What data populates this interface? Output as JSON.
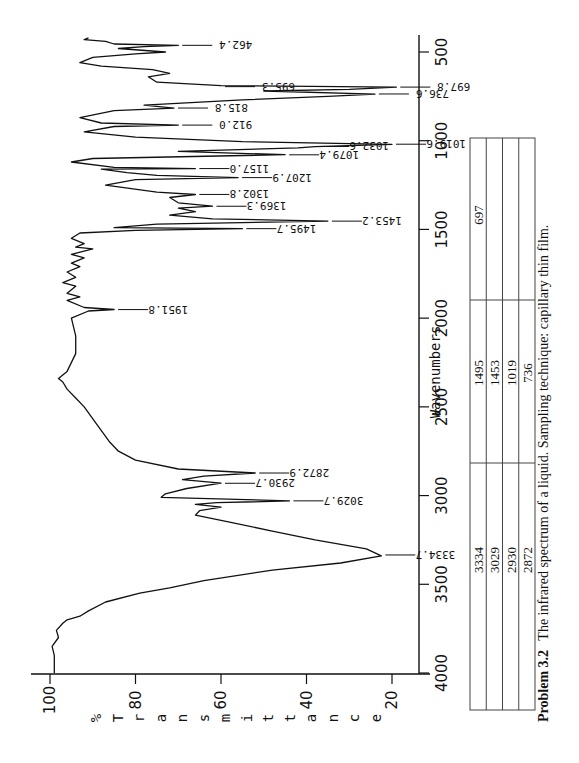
{
  "chart_data": {
    "type": "line",
    "title": "",
    "xlabel": "Wavenumbers",
    "ylabel": "% Transmittance",
    "x_reversed": true,
    "xlim": [
      4000,
      400
    ],
    "ylim": [
      15,
      102
    ],
    "orientation_note": "plot printed rotated 90 degrees clockwise on page",
    "x_ticks": [
      4000,
      3500,
      3000,
      2500,
      2000,
      1500,
      1000,
      500
    ],
    "y_ticks": [
      100,
      80,
      60,
      40,
      20
    ],
    "grid": false,
    "series": [
      {
        "name": "IR spectrum",
        "points": [
          [
            4000,
            99
          ],
          [
            3900,
            99
          ],
          [
            3850,
            99.5
          ],
          [
            3800,
            98
          ],
          [
            3760,
            98.5
          ],
          [
            3720,
            97
          ],
          [
            3700,
            96
          ],
          [
            3680,
            93
          ],
          [
            3650,
            91
          ],
          [
            3600,
            87
          ],
          [
            3550,
            79
          ],
          [
            3520,
            72
          ],
          [
            3480,
            64
          ],
          [
            3420,
            48
          ],
          [
            3380,
            32
          ],
          [
            3340,
            22.5
          ],
          [
            3300,
            26
          ],
          [
            3250,
            38
          ],
          [
            3200,
            48
          ],
          [
            3150,
            58
          ],
          [
            3110,
            66
          ],
          [
            3085,
            65
          ],
          [
            3065,
            60
          ],
          [
            3050,
            66
          ],
          [
            3040,
            61
          ],
          [
            3030,
            44
          ],
          [
            3010,
            74
          ],
          [
            2990,
            73
          ],
          [
            2960,
            68
          ],
          [
            2930,
            60
          ],
          [
            2910,
            69
          ],
          [
            2890,
            64
          ],
          [
            2873,
            52
          ],
          [
            2850,
            70
          ],
          [
            2800,
            80
          ],
          [
            2750,
            84
          ],
          [
            2700,
            86
          ],
          [
            2600,
            89
          ],
          [
            2500,
            92
          ],
          [
            2450,
            94
          ],
          [
            2400,
            96
          ],
          [
            2360,
            97
          ],
          [
            2340,
            98
          ],
          [
            2300,
            96
          ],
          [
            2200,
            94
          ],
          [
            2100,
            94
          ],
          [
            2000,
            95
          ],
          [
            1960,
            91
          ],
          [
            1951,
            85
          ],
          [
            1940,
            92
          ],
          [
            1900,
            96
          ],
          [
            1880,
            93
          ],
          [
            1860,
            96
          ],
          [
            1820,
            94
          ],
          [
            1800,
            97
          ],
          [
            1770,
            94
          ],
          [
            1740,
            96
          ],
          [
            1710,
            93
          ],
          [
            1690,
            95
          ],
          [
            1660,
            92
          ],
          [
            1640,
            95
          ],
          [
            1610,
            90
          ],
          [
            1600,
            94
          ],
          [
            1580,
            92
          ],
          [
            1550,
            95
          ],
          [
            1520,
            93
          ],
          [
            1505,
            80
          ],
          [
            1496,
            55
          ],
          [
            1490,
            85
          ],
          [
            1470,
            75
          ],
          [
            1453,
            35
          ],
          [
            1440,
            62
          ],
          [
            1420,
            72
          ],
          [
            1400,
            66
          ],
          [
            1380,
            70
          ],
          [
            1369,
            62
          ],
          [
            1350,
            70
          ],
          [
            1320,
            72
          ],
          [
            1303,
            66
          ],
          [
            1290,
            75
          ],
          [
            1250,
            87
          ],
          [
            1220,
            80
          ],
          [
            1208,
            56
          ],
          [
            1195,
            75
          ],
          [
            1180,
            82
          ],
          [
            1160,
            88
          ],
          [
            1157,
            66
          ],
          [
            1150,
            85
          ],
          [
            1120,
            95
          ],
          [
            1100,
            90
          ],
          [
            1079,
            45
          ],
          [
            1060,
            70
          ],
          [
            1040,
            42
          ],
          [
            1033,
            38
          ],
          [
            1020,
            20
          ],
          [
            1005,
            55
          ],
          [
            980,
            80
          ],
          [
            950,
            92
          ],
          [
            920,
            85
          ],
          [
            912,
            70
          ],
          [
            900,
            88
          ],
          [
            870,
            93
          ],
          [
            830,
            85
          ],
          [
            816,
            71
          ],
          [
            800,
            78
          ],
          [
            770,
            55
          ],
          [
            750,
            35
          ],
          [
            737,
            24
          ],
          [
            720,
            50
          ],
          [
            710,
            30
          ],
          [
            698,
            19
          ],
          [
            690,
            60
          ],
          [
            670,
            75
          ],
          [
            640,
            77
          ],
          [
            620,
            72
          ],
          [
            600,
            76
          ],
          [
            580,
            88
          ],
          [
            560,
            93
          ],
          [
            530,
            90
          ],
          [
            510,
            80
          ],
          [
            500,
            73
          ],
          [
            480,
            84
          ],
          [
            470,
            78
          ],
          [
            462,
            70
          ],
          [
            455,
            85
          ],
          [
            440,
            87
          ],
          [
            430,
            92
          ],
          [
            420,
            91
          ]
        ]
      }
    ],
    "peak_labels": [
      {
        "wavenumber": "462.4",
        "transmittance": 70
      },
      {
        "wavenumber": "695.3",
        "transmittance": 60
      },
      {
        "wavenumber": "697.8",
        "transmittance": 19
      },
      {
        "wavenumber": "736.6",
        "transmittance": 24
      },
      {
        "wavenumber": "815.8",
        "transmittance": 71
      },
      {
        "wavenumber": "912.0",
        "transmittance": 70
      },
      {
        "wavenumber": "1019.6",
        "transmittance": 20
      },
      {
        "wavenumber": "1032.6",
        "transmittance": 38
      },
      {
        "wavenumber": "1079.4",
        "transmittance": 45
      },
      {
        "wavenumber": "1157.0",
        "transmittance": 66
      },
      {
        "wavenumber": "1207.9",
        "transmittance": 56
      },
      {
        "wavenumber": "1302.8",
        "transmittance": 66
      },
      {
        "wavenumber": "1369.3",
        "transmittance": 62
      },
      {
        "wavenumber": "1453.2",
        "transmittance": 35
      },
      {
        "wavenumber": "1495.7",
        "transmittance": 55
      },
      {
        "wavenumber": "1951.8",
        "transmittance": 85
      },
      {
        "wavenumber": "2872.9",
        "transmittance": 52
      },
      {
        "wavenumber": "2930.7",
        "transmittance": 60
      },
      {
        "wavenumber": "3029.7",
        "transmittance": 44
      },
      {
        "wavenumber": "3334.7",
        "transmittance": 22.5
      }
    ]
  },
  "axis": {
    "x_title": "Wavenumbers",
    "y_title": "% T r a n s m i t t a n c e",
    "x_tick_labels": [
      "500",
      "1000",
      "1500",
      "2000",
      "2500",
      "3000",
      "3500",
      "4000"
    ],
    "y_tick_labels": [
      "100",
      "80",
      "60",
      "40",
      "20"
    ]
  },
  "peak_table": {
    "col1": [
      "3334",
      "3029",
      "2930",
      "2872"
    ],
    "col2": [
      "1495",
      "1453",
      "1019",
      "736"
    ],
    "col3": [
      "697",
      "",
      "",
      ""
    ]
  },
  "caption": {
    "label": "Problem 3.2",
    "text": "The infrared spectrum of a liquid.  Sampling technique: capillary thin film."
  }
}
